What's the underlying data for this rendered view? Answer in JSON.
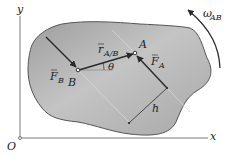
{
  "diagram": {
    "axes": {
      "origin_label": "O",
      "x_label": "x",
      "y_label": "y"
    },
    "body": {
      "fill_color": "#b4b4b4",
      "edge_color": "#555555"
    },
    "points": {
      "A": "A",
      "B": "B"
    },
    "vectors": {
      "F_B": {
        "symbol": "F",
        "subscript": "B"
      },
      "F_A": {
        "symbol": "F",
        "subscript": "A"
      },
      "r_AB": {
        "symbol": "r",
        "subscript": "A/B"
      }
    },
    "angle_label": "θ",
    "distance_label": "h",
    "angular_velocity": {
      "symbol": "ω",
      "subscript": "AB"
    },
    "colors": {
      "axis": "#7a7a7a",
      "vector": "#2a2a2a",
      "construction": "#9a9a9a"
    }
  }
}
